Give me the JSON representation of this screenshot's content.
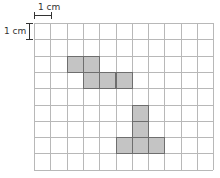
{
  "diagram": {
    "type": "grid-figure",
    "scale_label_horizontal": "1 cm",
    "scale_label_vertical": "1 cm",
    "grid": {
      "columns": 11,
      "rows": 9,
      "cell_px": 16.3,
      "line_color": "#b8b8b8"
    },
    "shading": {
      "fill": "#c4c4c4",
      "stroke": "#6e6e6e"
    },
    "shapes": [
      {
        "name": "shape-top",
        "cells": [
          [
            2,
            2
          ],
          [
            3,
            2
          ],
          [
            3,
            3
          ],
          [
            4,
            3
          ],
          [
            5,
            3
          ]
        ]
      },
      {
        "name": "shape-bottom",
        "cells": [
          [
            6,
            5
          ],
          [
            6,
            6
          ],
          [
            5,
            7
          ],
          [
            6,
            7
          ],
          [
            7,
            7
          ]
        ]
      }
    ]
  }
}
